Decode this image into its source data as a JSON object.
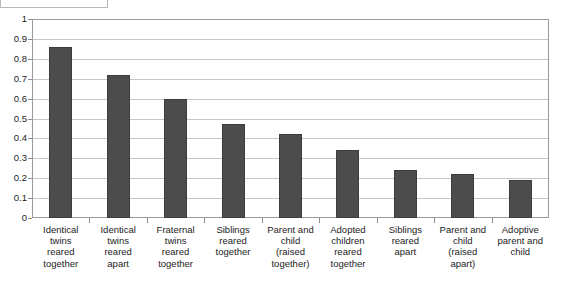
{
  "title_box": {
    "label": "",
    "note": "empty bordered box cropped at top edge"
  },
  "chart_data": {
    "type": "bar",
    "title": "",
    "subtitle": "",
    "xlabel": "",
    "ylabel": "",
    "ylim": [
      0,
      1
    ],
    "ytick_step": 0.1,
    "grid": true,
    "legend": "none",
    "bar_color": "#4c4c4c",
    "bar_border_color": "#3c3c3c",
    "gridline_color": "#c6c6ca",
    "axis_color": "#9a9a9e",
    "background": "#ffffff",
    "ytick_labels": [
      "1",
      "0.9",
      "0.8",
      "0.7",
      "0.6",
      "0.5",
      "0.4",
      "0.3",
      "0.2",
      "0.1",
      "0"
    ],
    "ytick_values": [
      1,
      0.9,
      0.8,
      0.7,
      0.6,
      0.5,
      0.4,
      0.3,
      0.2,
      0.1,
      0
    ],
    "categories": [
      "Identical twins reared together",
      "Identical twins reared apart",
      "Fraternal twins reared together",
      "Siblings reared together",
      "Parent and child (raised together)",
      "Adopted children reared together",
      "Siblings reared apart",
      "Parent and child (raised apart)",
      "Adoptive parent and child"
    ],
    "category_lines": [
      [
        "Identical",
        "twins",
        "reared",
        "together"
      ],
      [
        "Identical",
        "twins",
        "reared",
        "apart"
      ],
      [
        "Fraternal",
        "twins",
        "reared",
        "together"
      ],
      [
        "Siblings",
        "reared",
        "together"
      ],
      [
        "Parent and",
        "child",
        "(raised",
        "together)"
      ],
      [
        "Adopted",
        "children",
        "reared",
        "together"
      ],
      [
        "Siblings",
        "reared",
        "apart"
      ],
      [
        "Parent and",
        "child",
        "(raised",
        "apart)"
      ],
      [
        "Adoptive",
        "parent and",
        "child"
      ]
    ],
    "values": [
      0.86,
      0.72,
      0.6,
      0.47,
      0.42,
      0.34,
      0.24,
      0.22,
      0.19
    ]
  }
}
